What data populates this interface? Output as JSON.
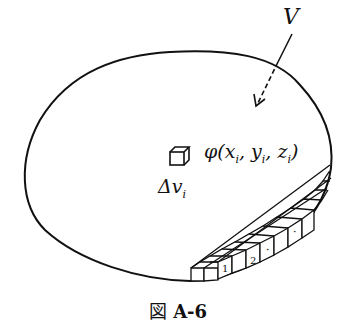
{
  "figure": {
    "caption_prefix": "図",
    "caption_id": "A-6",
    "labels": {
      "region": "V",
      "function": "φ(x",
      "function_args": [
        {
          "var": "x",
          "sub": "i"
        },
        {
          "var": "y",
          "sub": "i"
        },
        {
          "var": "z",
          "sub": "i"
        }
      ],
      "function_name": "φ",
      "volume_element": "Δv",
      "volume_element_sub": "i"
    },
    "brick_labels": [
      "1",
      "2",
      "·",
      "·"
    ],
    "colors": {
      "stroke": "#111111",
      "background": "#ffffff"
    }
  }
}
